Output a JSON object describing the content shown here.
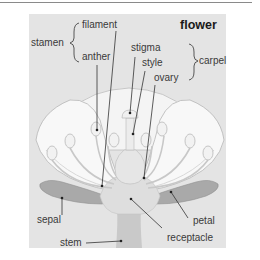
{
  "title": "flower",
  "groups": {
    "stamen": "stamen",
    "carpel": "carpel"
  },
  "labels": {
    "filament": "filament",
    "anther": "anther",
    "stigma": "stigma",
    "style": "style",
    "ovary": "ovary",
    "sepal": "sepal",
    "stem": "stem",
    "petal": "petal",
    "receptacle": "receptacle"
  },
  "colors": {
    "panel": "#e4e4e4",
    "petal_fill": "#f7f7f7",
    "petal_stroke": "#b8b8b8",
    "sepal_fill": "#a9a9a9",
    "stem_fill": "#c9c9c9",
    "leader_line": "#333333"
  }
}
